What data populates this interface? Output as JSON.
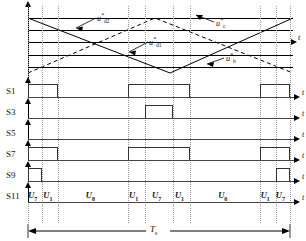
{
  "figure": {
    "type": "pwm-switching-waveform-timing-diagram",
    "title": ""
  },
  "chart_data": {
    "type": "line",
    "title": "",
    "xlabel": "t",
    "ylabel": "",
    "grid": true,
    "legend_position": "inline-annotations",
    "axis_tick_label": "t",
    "period_label": "T",
    "period_sub": "s",
    "carrier_waveforms": [
      {
        "name": "u*d2",
        "label_text": "u",
        "label_sub": "d2",
        "label_sup": "*",
        "style": "solid",
        "description": "descending-then-ascending triangular carrier starting high"
      },
      {
        "name": "u*d1",
        "label_text": "u",
        "label_sub": "d1",
        "label_sup": "*",
        "style": "solid",
        "description": "triangular carrier with valley at center"
      },
      {
        "name": "u*c",
        "label_text": "u",
        "label_sub": "c",
        "label_sup": "*",
        "style": "dashed",
        "description": "ascending-then-descending dashed triangular carrier peaking at center"
      },
      {
        "name": "u*b",
        "label_text": "u",
        "label_sub": "b",
        "label_sup": "*",
        "style": "dashed",
        "description": "dashed triangular carrier"
      }
    ],
    "reference_levels_y": [
      18,
      30,
      42,
      55,
      67
    ],
    "switch_rows": [
      {
        "label": "S1",
        "axis_label": "t",
        "pulses": [
          {
            "start_pct": 0.0,
            "end_pct": 11.5
          },
          {
            "start_pct": 38.0,
            "end_pct": 62.0
          },
          {
            "start_pct": 88.5,
            "end_pct": 100.0
          }
        ]
      },
      {
        "label": "S3",
        "axis_label": "t",
        "pulses": [
          {
            "start_pct": 44.5,
            "end_pct": 55.5
          }
        ]
      },
      {
        "label": "S5",
        "axis_label": "t",
        "pulses": []
      },
      {
        "label": "S7",
        "axis_label": "t",
        "pulses": [
          {
            "start_pct": 0.0,
            "end_pct": 11.5
          },
          {
            "start_pct": 38.0,
            "end_pct": 62.0
          },
          {
            "start_pct": 88.5,
            "end_pct": 100.0
          }
        ]
      },
      {
        "label": "S9",
        "axis_label": "t",
        "pulses": [
          {
            "start_pct": 0.0,
            "end_pct": 5.5
          },
          {
            "start_pct": 94.5,
            "end_pct": 100.0
          }
        ]
      },
      {
        "label": "S11",
        "axis_label": "t",
        "pulses": []
      }
    ],
    "vector_sequence": [
      {
        "text": "U",
        "sub": "7",
        "start_pct": 0.0,
        "end_pct": 5.5
      },
      {
        "text": "U",
        "sub": "1",
        "start_pct": 5.5,
        "end_pct": 11.5
      },
      {
        "text": "U",
        "sub": "8",
        "start_pct": 11.5,
        "end_pct": 38.0
      },
      {
        "text": "U",
        "sub": "1",
        "start_pct": 38.0,
        "end_pct": 44.5
      },
      {
        "text": "U",
        "sub": "7",
        "start_pct": 44.5,
        "end_pct": 55.5
      },
      {
        "text": "U",
        "sub": "1",
        "start_pct": 55.5,
        "end_pct": 62.0
      },
      {
        "text": "U",
        "sub": "0",
        "start_pct": 62.0,
        "end_pct": 88.5
      },
      {
        "text": "U",
        "sub": "1",
        "start_pct": 88.5,
        "end_pct": 94.5
      },
      {
        "text": "U",
        "sub": "7",
        "start_pct": 94.5,
        "end_pct": 100.0
      }
    ],
    "gridline_positions_pct": [
      0,
      5.5,
      11.5,
      38.0,
      44.5,
      55.5,
      62.0,
      88.5,
      94.5,
      100.0
    ]
  },
  "colors": {
    "line": "#000000",
    "grid": "#999999",
    "pulse": "#333333",
    "background": "#ffffff"
  }
}
